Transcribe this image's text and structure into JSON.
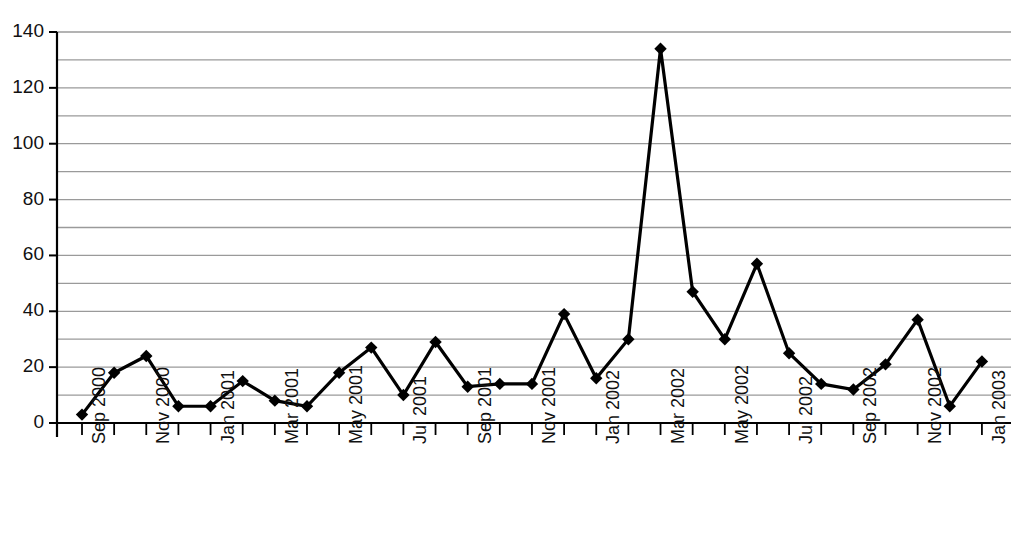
{
  "chart_data": {
    "type": "line",
    "title": "",
    "xlabel": "",
    "ylabel": "",
    "ylim": [
      0,
      140
    ],
    "y_major_step": 20,
    "y_gridline_step": 10,
    "grid": true,
    "legend": "none",
    "marker": "diamond",
    "line_color": "#000000",
    "grid_color": "#9a9a9a",
    "axis_color": "#000000",
    "categories": [
      "Sep 2000",
      "Oct 2000",
      "Nov 2000",
      "Dec 2000",
      "Jan 2001",
      "Feb 2001",
      "Mar 2001",
      "Apr 2001",
      "May 2001",
      "Jun 2001",
      "Jul 2001",
      "Aug 2001",
      "Sep 2001",
      "Oct 2001",
      "Nov 2001",
      "Dec 2001",
      "Jan 2002",
      "Feb 2002",
      "Mar 2002",
      "Apr 2002",
      "May 2002",
      "Jun 2002",
      "Jul 2002",
      "Aug 2002",
      "Sep 2002",
      "Oct 2002",
      "Nov 2002",
      "Dec 2002",
      "Jan 2003"
    ],
    "values": [
      3,
      18,
      24,
      6,
      6,
      15,
      8,
      6,
      18,
      27,
      10,
      29,
      13,
      14,
      14,
      39,
      16,
      30,
      134,
      47,
      30,
      57,
      25,
      14,
      12,
      21,
      37,
      6,
      22
    ],
    "x_tick_labels": [
      "Sep 2000",
      "",
      "Nov 2000",
      "",
      "Jan 2001",
      "",
      "Mar 2001",
      "",
      "May 2001",
      "",
      "Jul 2001",
      "",
      "Sep 2001",
      "",
      "Nov 2001",
      "",
      "Jan 2002",
      "",
      "Mar 2002",
      "",
      "May 2002",
      "",
      "Jul 2002",
      "",
      "Sep 2002",
      "",
      "Nov 2002",
      "",
      "Jan 2003"
    ],
    "y_tick_labels": [
      "0",
      "20",
      "40",
      "60",
      "80",
      "100",
      "120",
      "140"
    ],
    "y_tick_values": [
      0,
      20,
      40,
      60,
      80,
      100,
      120,
      140
    ]
  }
}
